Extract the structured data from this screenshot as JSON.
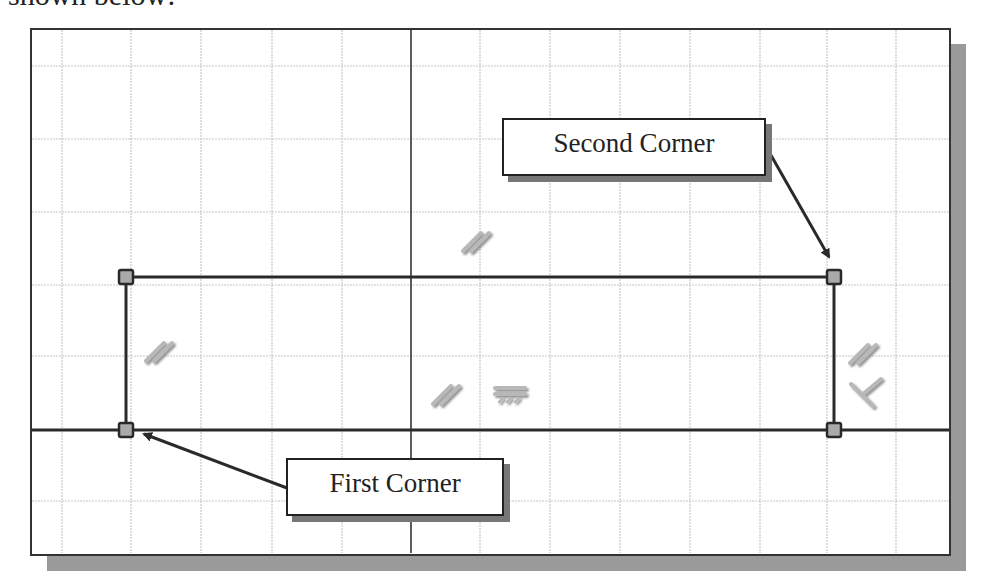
{
  "page": {
    "intro_text": "shown below:"
  },
  "diagram": {
    "type": "sketch-rectangle-constraints",
    "colors": {
      "grid": "#c8c8c8",
      "axis": "#333333",
      "geometry": "#2a2a2a",
      "point_fill": "#a9a9a9",
      "shadow": "#9a9a9a",
      "constraint_symbol": "#bcbcbc"
    },
    "points": [
      {
        "name": "first-corner",
        "x": 126,
        "y": 430
      },
      {
        "name": "top-left",
        "x": 126,
        "y": 277
      },
      {
        "name": "second-corner",
        "x": 834,
        "y": 277
      },
      {
        "name": "bottom-right",
        "x": 834,
        "y": 430
      }
    ],
    "constraints": [
      {
        "type": "parallel",
        "label": "//",
        "x": 470,
        "y": 240
      },
      {
        "type": "parallel",
        "label": "//",
        "x": 158,
        "y": 350
      },
      {
        "type": "parallel",
        "label": "//",
        "x": 440,
        "y": 395
      },
      {
        "type": "horizontal",
        "label": "horizontal",
        "x": 510,
        "y": 395
      },
      {
        "type": "parallel",
        "label": "//",
        "x": 864,
        "y": 352
      },
      {
        "type": "perpendicular",
        "label": "perpendicular",
        "x": 866,
        "y": 395
      }
    ]
  },
  "callouts": {
    "second_corner": {
      "label": "Second Corner"
    },
    "first_corner": {
      "label": "First Corner"
    }
  }
}
